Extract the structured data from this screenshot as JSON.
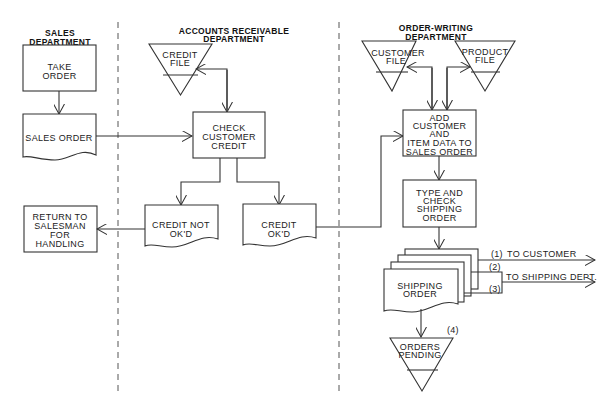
{
  "departments": [
    {
      "title_line1": "SALES",
      "title_line2": "DEPARTMENT"
    },
    {
      "title_line1": "ACCOUNTS RECEIVABLE",
      "title_line2": "DEPARTMENT"
    },
    {
      "title_line1": "ORDER-WRITING",
      "title_line2": "DEPARTMENT"
    }
  ],
  "sales": {
    "take_order": [
      "TAKE",
      "ORDER"
    ],
    "sales_order": "SALES  ORDER",
    "return": [
      "RETURN TO",
      "SALESMAN",
      "FOR",
      "HANDLING"
    ]
  },
  "ar": {
    "credit_file": [
      "CREDIT",
      "FILE"
    ],
    "check_credit": [
      "CHECK",
      "CUSTOMER",
      "CREDIT"
    ],
    "credit_not_ok": [
      "CREDIT  NOT",
      "OK'D"
    ],
    "credit_ok": [
      "CREDIT",
      "OK'D"
    ]
  },
  "ow": {
    "customer_file": [
      "CUSTOMER",
      "FILE"
    ],
    "product_file": [
      "PRODUCT",
      "FILE"
    ],
    "add_data": [
      "ADD",
      "CUSTOMER",
      "AND",
      "ITEM DATA TO",
      "SALES ORDER"
    ],
    "type_check": [
      "TYPE AND",
      "CHECK",
      "SHIPPING",
      "ORDER"
    ],
    "shipping_order": [
      "SHIPPING",
      "ORDER"
    ],
    "orders_pending": [
      "ORDERS",
      "PENDING"
    ],
    "copy_labels": [
      "(1)",
      "(2)",
      "(3)",
      "(4)"
    ],
    "to_customer": "TO  CUSTOMER",
    "to_shipping": "TO  SHIPPING  DEPT."
  }
}
